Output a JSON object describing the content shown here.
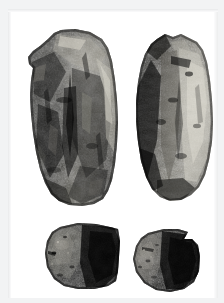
{
  "figure": {
    "medium": "black-and-white photograph",
    "background_color": "#ffffff",
    "frame_color": "#f2f3f4",
    "subject_count": 4,
    "layout": "two rows: two elongated tools above, two fragments below",
    "caption": ""
  },
  "specimens": [
    {
      "id": "specimen-top-left",
      "position": "top-left",
      "shape": "elongated sub-rectangular cobble tool, narrowing toward the base",
      "tone": "dark grey with mottled pale highlights along upper-right face",
      "dominant_color": "#3a3a38",
      "highlight_color": "#cfcdc6",
      "shadow_color": "#141414",
      "bbox": {
        "x": 20,
        "y": 28,
        "width": 92,
        "height": 170
      }
    },
    {
      "id": "specimen-top-right",
      "position": "top-right",
      "shape": "elongated ovoid cobble tool with rounded base",
      "tone": "dark left margin with bright weathered right face",
      "dominant_color": "#454441",
      "highlight_color": "#dedbd3",
      "shadow_color": "#111111",
      "bbox": {
        "x": 126,
        "y": 30,
        "width": 80,
        "height": 163
      }
    },
    {
      "id": "specimen-bottom-left",
      "position": "bottom-left",
      "shape": "wedge-shaped fragment, flat on the right, rounded on the left",
      "tone": "very dark with grainy pale flecks on the left",
      "dominant_color": "#232322",
      "highlight_color": "#8f8d86",
      "shadow_color": "#050505",
      "bbox": {
        "x": 36,
        "y": 214,
        "width": 80,
        "height": 69
      }
    },
    {
      "id": "specimen-bottom-right",
      "position": "bottom-right",
      "shape": "sub-circular fragment with a flattened upper-right edge",
      "tone": "near black with a lighter grey band on the left side",
      "dominant_color": "#1d1d1c",
      "highlight_color": "#8a8881",
      "shadow_color": "#040404",
      "bbox": {
        "x": 122,
        "y": 220,
        "width": 72,
        "height": 65
      }
    }
  ]
}
